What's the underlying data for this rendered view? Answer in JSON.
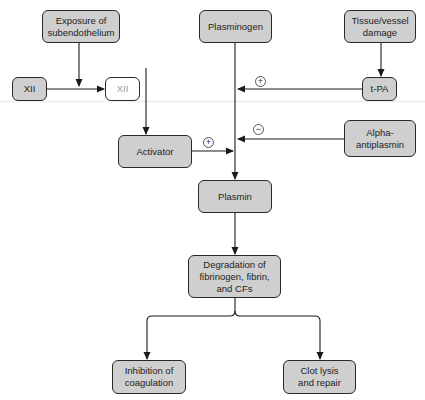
{
  "diagram": {
    "colors": {
      "box_fill": "#cfcfcf",
      "box_border": "#2a2a2a",
      "line": "#1a1a1a",
      "inactive_text": "#9a9a9a"
    },
    "nodes": {
      "exposure": {
        "label": "Exposure of\nsubendothelium"
      },
      "plasminogen": {
        "label": "Plasminogen"
      },
      "tissue_damage": {
        "label": "Tissue/vessel\ndamage"
      },
      "xii_inactive": {
        "label": "XII"
      },
      "xii_active": {
        "label": "XII"
      },
      "tpa": {
        "label": "t-PA"
      },
      "activator": {
        "label": "Activator"
      },
      "alpha_antiplasmin": {
        "label": "Alpha-\nantiplasmin"
      },
      "plasmin": {
        "label": "Plasmin"
      },
      "degradation": {
        "label": "Degradation of\nfibrinogen, fibrin,\nand CFs"
      },
      "inhibition": {
        "label": "Inhibition of\ncoagulation"
      },
      "clot_lysis": {
        "label": "Clot lysis\nand repair"
      }
    },
    "signs": {
      "tpa_effect": "+",
      "activator_effect": "+",
      "antiplasmin_effect": "−"
    },
    "edges": [
      {
        "from": "exposure",
        "to": "xii_inactive->xii_active"
      },
      {
        "from": "xii_inactive",
        "to": "xii_active"
      },
      {
        "from": "xii_active",
        "to": "activator"
      },
      {
        "from": "tissue_damage",
        "to": "tpa"
      },
      {
        "from": "tpa",
        "to": "plasminogen->plasmin",
        "sign": "+"
      },
      {
        "from": "activator",
        "to": "plasminogen->plasmin",
        "sign": "+"
      },
      {
        "from": "alpha_antiplasmin",
        "to": "plasminogen->plasmin",
        "sign": "−"
      },
      {
        "from": "plasminogen",
        "to": "plasmin"
      },
      {
        "from": "plasmin",
        "to": "degradation"
      },
      {
        "from": "degradation",
        "to": "inhibition"
      },
      {
        "from": "degradation",
        "to": "clot_lysis"
      }
    ]
  }
}
